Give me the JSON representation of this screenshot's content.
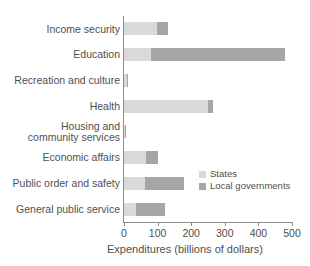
{
  "chart_data": {
    "type": "bar",
    "orientation": "horizontal",
    "stacked": true,
    "title": "",
    "xlabel": "Expenditures (billions of dollars)",
    "ylabel": "",
    "xlim": [
      0,
      500
    ],
    "xticks": [
      0,
      100,
      200,
      300,
      400,
      500
    ],
    "xtick_labels": [
      "0",
      "100",
      "200",
      "300",
      "400",
      "500"
    ],
    "grid": false,
    "legend_position": "inside-right-lower",
    "categories": [
      "Income security",
      "Education",
      "Recreation and culture",
      "Health",
      "Housing and\ncommunity services",
      "Economic affairs",
      "Public order and safety",
      "General public service"
    ],
    "series": [
      {
        "name": "States",
        "color": "#d9d9d9",
        "values": [
          98,
          80,
          9,
          250,
          3,
          66,
          62,
          36
        ]
      },
      {
        "name": "Local governments",
        "color": "#a6a6a6",
        "values": [
          33,
          399,
          4,
          15,
          2,
          35,
          117,
          86
        ]
      }
    ],
    "totals": [
      131,
      479,
      13,
      265,
      5,
      101,
      179,
      122
    ]
  },
  "legend": {
    "items": [
      {
        "label": "States",
        "color": "#d9d9d9"
      },
      {
        "label": "Local governments",
        "color": "#a6a6a6"
      }
    ]
  },
  "axis": {
    "x_title": "Expenditures (billions of dollars)",
    "ticks": [
      {
        "value": 0,
        "label": "0"
      },
      {
        "value": 100,
        "label": "100"
      },
      {
        "value": 200,
        "label": "200"
      },
      {
        "value": 300,
        "label": "300"
      },
      {
        "value": 400,
        "label": "400"
      },
      {
        "value": 500,
        "label": "500"
      }
    ]
  }
}
